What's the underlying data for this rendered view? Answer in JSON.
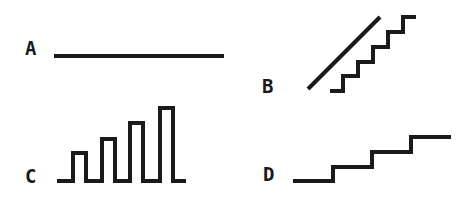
{
  "figure": {
    "panels": [
      {
        "id": "A",
        "label": "A",
        "shape": "flat-line",
        "description": "constant horizontal line"
      },
      {
        "id": "B",
        "label": "B",
        "shape": "ramp-and-staircase",
        "description": "diagonal ramp line beside a fine staircase"
      },
      {
        "id": "C",
        "label": "C",
        "shape": "increasing-pulses",
        "description": "four rectangular pulses of increasing height on a baseline"
      },
      {
        "id": "D",
        "label": "D",
        "shape": "staircase",
        "description": "three-step rising staircase"
      }
    ],
    "colors": {
      "stroke": "#1a1a1a",
      "background": "#ffffff"
    }
  }
}
